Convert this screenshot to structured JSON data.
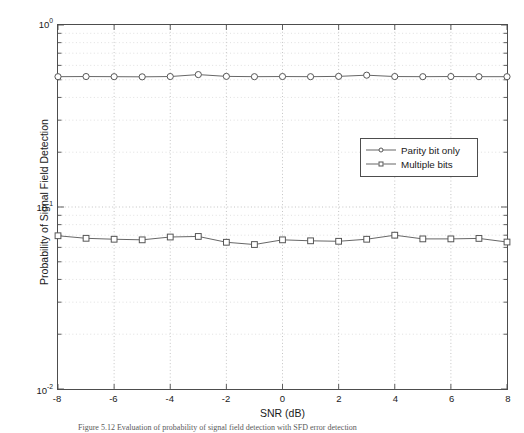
{
  "figure": {
    "caption": "Figure 5.12  Evaluation of probability of signal field detection with SFD error detection"
  },
  "axes": {
    "xlabel": "SNR (dB)",
    "ylabel": "Probability of Signal Field Detection",
    "xticks": [
      "-8",
      "-6",
      "-4",
      "-2",
      "0",
      "2",
      "4",
      "6",
      "8"
    ],
    "yticks": [
      {
        "mantissa": "10",
        "exponent": "0"
      },
      {
        "mantissa": "10",
        "exponent": "-1"
      },
      {
        "mantissa": "10",
        "exponent": "-2"
      }
    ]
  },
  "legend": {
    "items": [
      {
        "label": "Parity bit only",
        "marker": "circle-marker"
      },
      {
        "label": "Multiple bits",
        "marker": "square-marker"
      }
    ]
  },
  "colors": {
    "line": "#666666",
    "marker_edge": "#555555",
    "axis": "#4d4d4d",
    "grid_major": "#b4b4b4",
    "grid_minor": "#d2d2d2",
    "background": "#ffffff"
  },
  "chart_data": {
    "type": "line",
    "title": "",
    "xlabel": "SNR (dB)",
    "ylabel": "Probability of Signal Field Detection",
    "yscale": "log",
    "xlim": [
      -8,
      8
    ],
    "ylim": [
      0.01,
      1
    ],
    "grid": true,
    "legend_position": "center-right",
    "x": [
      -8,
      -7,
      -6,
      -5,
      -4,
      -3,
      -2,
      -1,
      0,
      1,
      2,
      3,
      4,
      5,
      6,
      7,
      8
    ],
    "series": [
      {
        "name": "Parity bit only",
        "marker": "o",
        "values": [
          0.52,
          0.521,
          0.52,
          0.519,
          0.521,
          0.534,
          0.522,
          0.52,
          0.521,
          0.52,
          0.522,
          0.53,
          0.521,
          0.52,
          0.521,
          0.52,
          0.52
        ]
      },
      {
        "name": "Multiple bits",
        "marker": "s",
        "values": [
          0.0695,
          0.0673,
          0.0665,
          0.066,
          0.0684,
          0.0689,
          0.064,
          0.0622,
          0.066,
          0.0652,
          0.0648,
          0.0665,
          0.07,
          0.0668,
          0.0668,
          0.0672,
          0.0642
        ]
      }
    ]
  }
}
